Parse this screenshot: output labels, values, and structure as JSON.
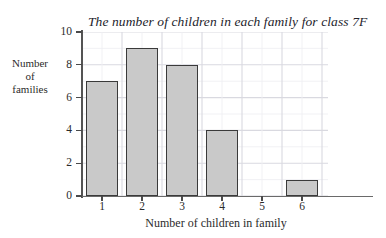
{
  "chart_data": {
    "type": "bar",
    "title": "The number of children in each family for class 7F",
    "xlabel": "Number of children in family",
    "ylabel": "Number of families",
    "ylabel_lines": [
      "Number",
      "of",
      "families"
    ],
    "categories": [
      "1",
      "2",
      "3",
      "4",
      "5",
      "6"
    ],
    "values": [
      7,
      9,
      8,
      4,
      0,
      1
    ],
    "series": [
      {
        "name": "Number of families",
        "values": [
          7,
          9,
          8,
          4,
          0,
          1
        ]
      }
    ],
    "ylim": [
      0,
      10
    ],
    "yticks": [
      0,
      2,
      4,
      6,
      8,
      10
    ],
    "ytick_labels": [
      "0",
      "2",
      "4",
      "6",
      "8",
      "10"
    ],
    "xtick_labels": [
      "1",
      "2",
      "3",
      "4",
      "5",
      "6"
    ],
    "grid": true,
    "grid_minor": true,
    "legend": null,
    "bar_fill_color": "#c9c9c9",
    "bar_edge_color": "#3a3a3a",
    "grid_major_color": "#d9d9e0",
    "grid_minor_color": "#efeff3",
    "axis_color": "#5a5a5a",
    "background_color": "#ffffff",
    "text_color": "#2b2b2b"
  }
}
